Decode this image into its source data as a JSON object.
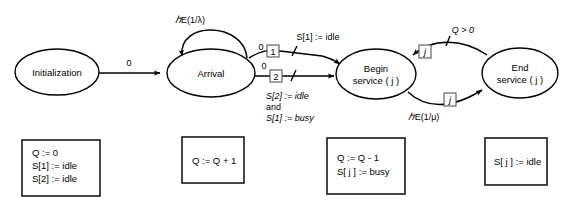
{
  "diagram": {
    "type": "event-graph",
    "nodes": [
      {
        "id": "initialization",
        "label_line1": "Initialization",
        "label_line2": "",
        "cx": 57,
        "cy": 72,
        "rx": 42,
        "ry": 23
      },
      {
        "id": "arrival",
        "label_line1": "Arrival",
        "label_line2": "",
        "cx": 211,
        "cy": 73,
        "rx": 44,
        "ry": 24
      },
      {
        "id": "begin-service",
        "label_line1": "Begin",
        "label_line2": "service ( j )",
        "cx": 376,
        "cy": 74,
        "rx": 40,
        "ry": 25
      },
      {
        "id": "end-service",
        "label_line1": "End",
        "label_line2": "service ( j )",
        "cx": 520,
        "cy": 73,
        "rx": 38,
        "ry": 25
      }
    ],
    "edges": [
      {
        "id": "init-to-arrival",
        "from": "initialization",
        "to": "arrival",
        "priority": "0",
        "condition": "",
        "marker": "",
        "delay": ""
      },
      {
        "id": "arrival-self-loop",
        "from": "arrival",
        "to": "arrival",
        "priority": "",
        "condition": "",
        "marker": "",
        "delay": "E(1/λ)"
      },
      {
        "id": "arrival-to-begin-1",
        "from": "arrival",
        "to": "begin-service",
        "priority": "0",
        "marker": "1",
        "condition": "S[1] := idle",
        "delay": ""
      },
      {
        "id": "arrival-to-begin-2",
        "from": "arrival",
        "to": "begin-service",
        "priority": "0",
        "marker": "2",
        "condition_line1": "S[2] := idle",
        "condition_line2": "and",
        "condition_line3": "S[1] := busy",
        "delay": ""
      },
      {
        "id": "begin-to-end",
        "from": "begin-service",
        "to": "end-service",
        "priority": "",
        "marker": "j",
        "condition": "",
        "delay": "E(1/μ)"
      },
      {
        "id": "end-to-begin",
        "from": "end-service",
        "to": "begin-service",
        "priority": "",
        "marker": "j",
        "condition": "Q > 0",
        "delay": ""
      }
    ],
    "state_boxes": [
      {
        "id": "initialization-state",
        "for_node": "initialization",
        "lines": [
          "Q := 0",
          "S[1] := idle",
          "S[2] := idle"
        ],
        "x": 22,
        "y": 140,
        "w": 78,
        "h": 56
      },
      {
        "id": "arrival-state",
        "for_node": "arrival",
        "lines": [
          "Q := Q + 1"
        ],
        "x": 182,
        "y": 137,
        "w": 62,
        "h": 46
      },
      {
        "id": "begin-service-state",
        "for_node": "begin-service",
        "lines": [
          "Q := Q - 1",
          "S[ j ] := busy"
        ],
        "x": 327,
        "y": 138,
        "w": 78,
        "h": 56
      },
      {
        "id": "end-service-state",
        "for_node": "end-service",
        "lines": [
          "S[ j ] := idle"
        ],
        "x": 485,
        "y": 138,
        "w": 62,
        "h": 47
      }
    ],
    "symbols": {
      "lambda_delay": "E(1/λ)",
      "mu_delay": "E(1/μ)",
      "queue_condition": "Q > 0",
      "script_e": "ℰ"
    },
    "colors": {
      "stroke": "#000000",
      "background": "#ffffff",
      "marker_box_stroke": "#555555",
      "state_box_stroke": "#1a1a1a"
    }
  }
}
